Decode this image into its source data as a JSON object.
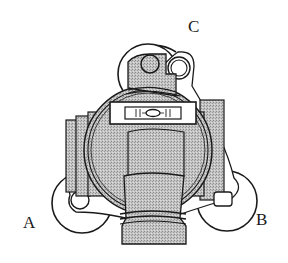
{
  "diagram": {
    "labels": {
      "a": "A",
      "b": "B",
      "c": "C"
    },
    "colors": {
      "ink": "#1a1a1a",
      "fill_shade": "#b8b8b8",
      "fill_dark": "#9a9a9a",
      "background": "#ffffff"
    }
  }
}
